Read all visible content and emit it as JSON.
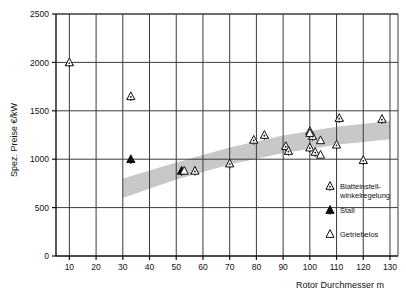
{
  "chart_data": {
    "type": "scatter",
    "title": "",
    "xlabel": "Rotor Durchmesser  m",
    "ylabel": "Spez. Preise €/kW",
    "xlim": [
      5,
      133
    ],
    "ylim": [
      0,
      2500
    ],
    "xticks": [
      10,
      20,
      30,
      40,
      50,
      60,
      70,
      80,
      90,
      100,
      110,
      120,
      130
    ],
    "yticks": [
      0,
      500,
      1000,
      1500,
      2000,
      2500
    ],
    "xtick_labels": [
      "10",
      "20",
      "30",
      "40",
      "50",
      "60",
      "70",
      "80",
      "90",
      "100",
      "110",
      "120",
      "130"
    ],
    "ytick_labels": [
      "0",
      "500",
      "1000",
      "1500",
      "2000",
      "2500"
    ],
    "grid": true,
    "legend_position": "bottom-right",
    "series": [
      {
        "name": "Blatteinstell-winkelregelung",
        "marker": "rotor-open",
        "points": [
          {
            "x": 10,
            "y": 2000
          },
          {
            "x": 33,
            "y": 1650
          },
          {
            "x": 57,
            "y": 880
          },
          {
            "x": 70,
            "y": 955
          },
          {
            "x": 79,
            "y": 1200
          },
          {
            "x": 83,
            "y": 1250
          },
          {
            "x": 91,
            "y": 1135
          },
          {
            "x": 92,
            "y": 1085
          },
          {
            "x": 100,
            "y": 1290
          },
          {
            "x": 100,
            "y": 1120
          },
          {
            "x": 101,
            "y": 1240
          },
          {
            "x": 102,
            "y": 1075
          },
          {
            "x": 110,
            "y": 1150
          },
          {
            "x": 111,
            "y": 1425
          },
          {
            "x": 120,
            "y": 990
          },
          {
            "x": 127,
            "y": 1415
          }
        ]
      },
      {
        "name": "Stall",
        "marker": "rotor-filled",
        "points": [
          {
            "x": 33,
            "y": 1000
          },
          {
            "x": 52,
            "y": 880
          }
        ]
      },
      {
        "name": "Getriebelos",
        "marker": "triangle-open",
        "points": [
          {
            "x": 53,
            "y": 880
          },
          {
            "x": 100,
            "y": 1270
          },
          {
            "x": 104,
            "y": 1195
          },
          {
            "x": 104,
            "y": 1045
          }
        ]
      }
    ],
    "band": {
      "description": "grey trend band rising from ~600-800 at 30 m to ~1200-1400 at 130 m",
      "color": "#c8c8c8",
      "upper": [
        {
          "x": 30,
          "y": 800
        },
        {
          "x": 50,
          "y": 965
        },
        {
          "x": 70,
          "y": 1120
        },
        {
          "x": 90,
          "y": 1245
        },
        {
          "x": 110,
          "y": 1335
        },
        {
          "x": 130,
          "y": 1395
        }
      ],
      "lower": [
        {
          "x": 30,
          "y": 600
        },
        {
          "x": 50,
          "y": 790
        },
        {
          "x": 70,
          "y": 945
        },
        {
          "x": 90,
          "y": 1065
        },
        {
          "x": 110,
          "y": 1150
        },
        {
          "x": 130,
          "y": 1205
        }
      ]
    }
  },
  "legend": {
    "items": [
      {
        "label_line1": "Blatteinstell-",
        "label_line2": "winkelregelung",
        "marker": "rotor-open"
      },
      {
        "label_line1": "Stall",
        "label_line2": "",
        "marker": "rotor-filled"
      },
      {
        "label_line1": "Getriebelos",
        "label_line2": "",
        "marker": "triangle-open"
      }
    ]
  },
  "axes": {
    "y_title": "Spez. Preise €/kW",
    "x_title": "Rotor  Durchmesser  m"
  },
  "colors": {
    "band": "#c8c8c8",
    "grid": "#3a3a3a",
    "axis": "#111111",
    "marker": "#111111",
    "background": "#ffffff"
  }
}
